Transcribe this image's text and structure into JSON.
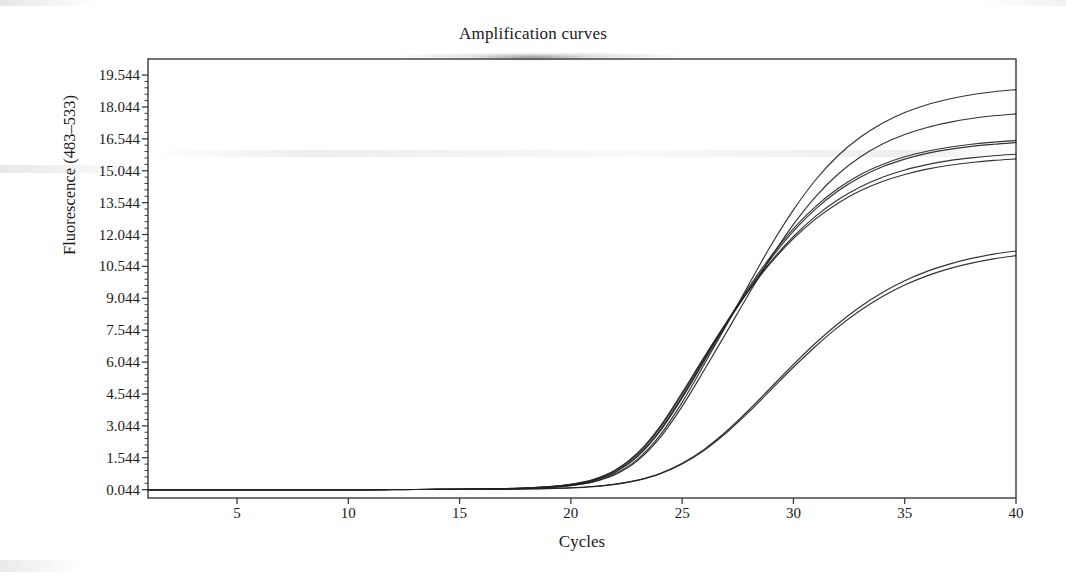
{
  "figure": {
    "title": "Amplification curves",
    "background_color": "#ffffff",
    "line_color": "#222222",
    "axis_color": "#3a3a3a"
  },
  "chart_data": {
    "type": "line",
    "title": "Amplification curves",
    "xlabel": "Cycles",
    "ylabel": "Fluorescence (483–533)",
    "xlim": [
      1,
      40
    ],
    "ylim": [
      -0.35,
      20.3
    ],
    "grid": false,
    "legend": "none",
    "xticks": [
      5,
      10,
      15,
      20,
      25,
      30,
      35,
      40
    ],
    "xtick_labels": [
      "5",
      "10",
      "15",
      "20",
      "25",
      "30",
      "35",
      "40"
    ],
    "yticks": [
      0.044,
      1.544,
      3.044,
      4.544,
      6.044,
      7.544,
      9.044,
      10.544,
      12.044,
      13.544,
      15.044,
      16.544,
      18.044,
      19.544
    ],
    "ytick_labels": [
      "0.044",
      "1.544",
      "3.044",
      "4.544",
      "6.044",
      "7.544",
      "9.044",
      "10.544",
      "12.044",
      "13.544",
      "15.044",
      "16.544",
      "18.044",
      "19.544"
    ],
    "x": [
      1,
      2,
      3,
      4,
      5,
      6,
      7,
      8,
      9,
      10,
      11,
      12,
      13,
      14,
      15,
      16,
      17,
      18,
      19,
      20,
      21,
      22,
      23,
      24,
      25,
      26,
      27,
      28,
      29,
      30,
      31,
      32,
      33,
      34,
      35,
      36,
      37,
      38,
      39,
      40
    ],
    "series": [
      {
        "name": "Sample 1",
        "values": [
          0.044,
          0.044,
          0.044,
          0.044,
          0.044,
          0.044,
          0.045,
          0.045,
          0.046,
          0.046,
          0.047,
          0.048,
          0.05,
          0.053,
          0.058,
          0.066,
          0.08,
          0.105,
          0.15,
          0.24,
          0.42,
          0.79,
          1.48,
          2.6,
          4.15,
          5.95,
          7.8,
          9.7,
          11.55,
          13.2,
          14.62,
          15.75,
          16.62,
          17.28,
          17.78,
          18.15,
          18.42,
          18.62,
          18.76,
          18.86
        ]
      },
      {
        "name": "Sample 2",
        "values": [
          0.044,
          0.044,
          0.044,
          0.044,
          0.044,
          0.044,
          0.045,
          0.045,
          0.046,
          0.046,
          0.047,
          0.048,
          0.05,
          0.053,
          0.058,
          0.066,
          0.079,
          0.102,
          0.145,
          0.232,
          0.405,
          0.755,
          1.41,
          2.48,
          3.96,
          5.68,
          7.46,
          9.26,
          10.98,
          12.52,
          13.83,
          14.88,
          15.69,
          16.3,
          16.75,
          17.08,
          17.32,
          17.5,
          17.63,
          17.72
        ]
      },
      {
        "name": "Sample 3",
        "values": [
          0.044,
          0.044,
          0.044,
          0.044,
          0.044,
          0.044,
          0.045,
          0.045,
          0.046,
          0.046,
          0.047,
          0.048,
          0.05,
          0.054,
          0.06,
          0.07,
          0.086,
          0.114,
          0.166,
          0.268,
          0.47,
          0.88,
          1.63,
          2.82,
          4.42,
          6.18,
          7.92,
          9.56,
          11.04,
          12.32,
          13.37,
          14.21,
          14.86,
          15.34,
          15.7,
          15.96,
          16.15,
          16.29,
          16.39,
          16.46
        ]
      },
      {
        "name": "Sample 4",
        "values": [
          0.044,
          0.044,
          0.044,
          0.044,
          0.044,
          0.044,
          0.045,
          0.045,
          0.046,
          0.046,
          0.047,
          0.048,
          0.05,
          0.054,
          0.06,
          0.07,
          0.085,
          0.112,
          0.163,
          0.263,
          0.462,
          0.865,
          1.605,
          2.78,
          4.36,
          6.1,
          7.83,
          9.46,
          10.93,
          12.2,
          13.25,
          14.09,
          14.74,
          15.23,
          15.59,
          15.86,
          16.05,
          16.19,
          16.29,
          16.37
        ]
      },
      {
        "name": "Sample 5",
        "values": [
          0.044,
          0.044,
          0.044,
          0.044,
          0.044,
          0.044,
          0.045,
          0.045,
          0.046,
          0.046,
          0.047,
          0.049,
          0.052,
          0.056,
          0.063,
          0.074,
          0.092,
          0.122,
          0.178,
          0.288,
          0.505,
          0.94,
          1.72,
          2.94,
          4.54,
          6.25,
          7.9,
          9.43,
          10.79,
          11.95,
          12.91,
          13.68,
          14.28,
          14.74,
          15.08,
          15.33,
          15.52,
          15.65,
          15.75,
          15.82
        ]
      },
      {
        "name": "Sample 6",
        "values": [
          0.044,
          0.044,
          0.044,
          0.044,
          0.044,
          0.044,
          0.045,
          0.045,
          0.046,
          0.046,
          0.047,
          0.049,
          0.052,
          0.057,
          0.064,
          0.076,
          0.095,
          0.126,
          0.184,
          0.298,
          0.522,
          0.97,
          1.77,
          3.01,
          4.61,
          6.3,
          7.92,
          9.41,
          10.73,
          11.85,
          12.78,
          13.52,
          14.1,
          14.54,
          14.87,
          15.12,
          15.3,
          15.43,
          15.53,
          15.6
        ]
      },
      {
        "name": "Sample 7",
        "values": [
          0.044,
          0.044,
          0.044,
          0.044,
          0.044,
          0.044,
          0.044,
          0.045,
          0.045,
          0.046,
          0.046,
          0.047,
          0.048,
          0.05,
          0.053,
          0.057,
          0.064,
          0.076,
          0.096,
          0.13,
          0.192,
          0.3,
          0.49,
          0.8,
          1.28,
          1.95,
          2.8,
          3.79,
          4.86,
          5.93,
          6.94,
          7.85,
          8.65,
          9.32,
          9.87,
          10.31,
          10.65,
          10.92,
          11.12,
          11.27
        ]
      },
      {
        "name": "Sample 8",
        "values": [
          0.044,
          0.044,
          0.044,
          0.044,
          0.044,
          0.044,
          0.044,
          0.045,
          0.045,
          0.046,
          0.046,
          0.047,
          0.048,
          0.05,
          0.053,
          0.057,
          0.063,
          0.075,
          0.094,
          0.127,
          0.187,
          0.292,
          0.478,
          0.78,
          1.25,
          1.9,
          2.73,
          3.7,
          4.75,
          5.8,
          6.79,
          7.69,
          8.47,
          9.13,
          9.67,
          10.1,
          10.44,
          10.7,
          10.9,
          11.05
        ]
      }
    ]
  }
}
